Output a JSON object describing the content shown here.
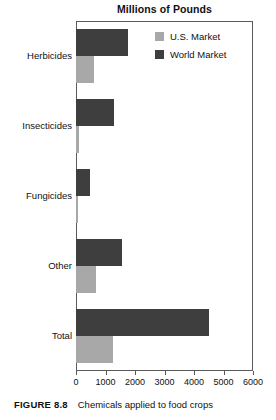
{
  "figure": {
    "caption_label": "FIGURE 8.8",
    "caption_text": "Chemicals applied to food crops"
  },
  "legend": {
    "position": "top-right",
    "items": [
      {
        "label": "U.S. Market",
        "color": "#a8a8a8",
        "swatch_name": "legend-swatch-us-market"
      },
      {
        "label": "World Market",
        "color": "#3e3e3e",
        "swatch_name": "legend-swatch-world-market"
      }
    ]
  },
  "axis": {
    "ticks": [
      "0",
      "1000",
      "2000",
      "3000",
      "4000",
      "5000",
      "6000"
    ]
  },
  "chart_data": {
    "type": "bar",
    "orientation": "horizontal",
    "title": "Millions of Pounds",
    "xlabel": "",
    "ylabel": "",
    "xlim": [
      0,
      6000
    ],
    "xticks": [
      0,
      1000,
      2000,
      3000,
      4000,
      5000,
      6000
    ],
    "grid": false,
    "legend_position": "top-right",
    "categories": [
      "Herbicides",
      "Insecticides",
      "Fungicides",
      "Other",
      "Total"
    ],
    "series": [
      {
        "name": "World Market",
        "color": "#3e3e3e",
        "values": [
          1750,
          1300,
          475,
          1550,
          4500
        ]
      },
      {
        "name": "U.S. Market",
        "color": "#a8a8a8",
        "values": [
          600,
          100,
          70,
          680,
          1250
        ]
      }
    ]
  }
}
